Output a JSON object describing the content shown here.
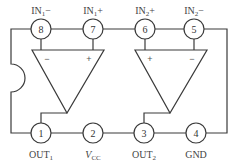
{
  "pins": [
    {
      "number": "1",
      "label": "OUT",
      "sub": "1"
    },
    {
      "number": "2",
      "label": "V",
      "sub": "CC"
    },
    {
      "number": "3",
      "label": "OUT",
      "sub": "2"
    },
    {
      "number": "4",
      "label": "GND",
      "sub": ""
    },
    {
      "number": "5",
      "label": "IN",
      "sub": "2",
      "suffix": "−"
    },
    {
      "number": "6",
      "label": "IN",
      "sub": "2",
      "suffix": "+"
    },
    {
      "number": "7",
      "label": "IN",
      "sub": "1",
      "suffix": "+"
    },
    {
      "number": "8",
      "label": "IN",
      "sub": "1",
      "suffix": "−"
    }
  ],
  "opamps": [
    {
      "name": "op-amp-1",
      "left_sign": "−",
      "right_sign": "+"
    },
    {
      "name": "op-amp-2",
      "left_sign": "+",
      "right_sign": "−"
    }
  ],
  "colors": {
    "line": "#3a3a3a",
    "background": "#ffffff"
  }
}
